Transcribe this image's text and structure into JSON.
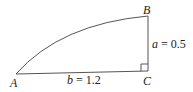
{
  "diagram": {
    "type": "right-triangle-with-arc",
    "vertices": {
      "A": {
        "label": "A",
        "x": 16,
        "y": 74
      },
      "B": {
        "label": "B",
        "x": 148,
        "y": 16
      },
      "C": {
        "label": "C",
        "x": 148,
        "y": 71
      }
    },
    "sides": {
      "a": {
        "var": "a",
        "eq": " = 0.5",
        "text": "a = 0.5"
      },
      "b": {
        "var": "b",
        "eq": " = 1.2",
        "text": "b = 1.2"
      }
    },
    "right_angle_at": "C",
    "stroke_color": "#555555"
  }
}
